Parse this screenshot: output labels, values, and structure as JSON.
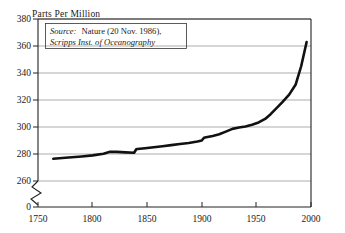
{
  "chart_data": {
    "type": "line",
    "title": "",
    "ylabel": "Parts Per Million",
    "xlabel": "",
    "xlim": [
      1750,
      2000
    ],
    "ylim": [
      260,
      380
    ],
    "grid": true,
    "legend": "none",
    "y_axis_break": true,
    "y_break_label": "0",
    "yticks": [
      380,
      360,
      340,
      320,
      300,
      280,
      260
    ],
    "ytick_labels": [
      "380",
      "360",
      "340",
      "320",
      "300",
      "280",
      "260"
    ],
    "xticks": [
      1750,
      1800,
      1850,
      1900,
      1950,
      2000
    ],
    "xtick_labels": [
      "1750",
      "1800",
      "1850",
      "1900",
      "1950",
      "2000"
    ],
    "annotation": {
      "line1_emph": "Source:",
      "line1_rest": "Nature (20 Nov. 1986),",
      "line2": "Scripps Inst. of Oceanography"
    },
    "series": [
      {
        "name": "Atmospheric CO2 concentration",
        "x": [
          1764,
          1775,
          1790,
          1800,
          1810,
          1816,
          1822,
          1830,
          1838,
          1840,
          1841,
          1848,
          1856,
          1864,
          1872,
          1880,
          1888,
          1896,
          1900,
          1902,
          1904,
          1910,
          1916,
          1922,
          1928,
          1934,
          1940,
          1946,
          1952,
          1958,
          1963,
          1968,
          1974,
          1980,
          1986,
          1991,
          1996
        ],
        "y": [
          276.5,
          277.2,
          278.2,
          279.0,
          280.2,
          281.6,
          281.6,
          281.2,
          280.9,
          283.5,
          283.7,
          284.3,
          285.0,
          285.8,
          286.6,
          287.4,
          288.2,
          289.2,
          290.0,
          292.0,
          292.4,
          293.4,
          294.6,
          296.6,
          298.6,
          299.6,
          300.4,
          301.6,
          303.4,
          306.0,
          309.5,
          313.6,
          318.6,
          324.0,
          331.5,
          345.0,
          363.0
        ]
      }
    ]
  }
}
